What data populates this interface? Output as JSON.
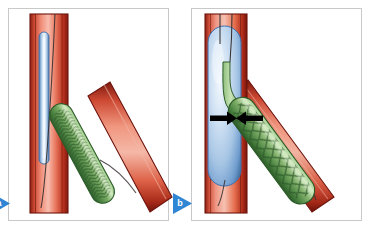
{
  "figure": {
    "background_color": "#ffffff",
    "width": 370,
    "height": 229,
    "panel_frame_color": "#c9c9c9"
  },
  "palette": {
    "vessel_red_dark": "#8c1f14",
    "vessel_red_mid": "#d24a35",
    "vessel_red_light": "#f09a86",
    "vessel_highlight": "#f7c4b5",
    "vessel_outline": "#6e140c",
    "balloon_blue_dark": "#3f6fae",
    "balloon_blue_mid": "#9fc2e4",
    "balloon_blue_light": "#eaf2fb",
    "stent_green_dark": "#2f6b35",
    "stent_green_mid": "#6aa65c",
    "stent_green_light": "#a8cf92",
    "stent_mesh": "#31582c",
    "guidewire": "#332f2f",
    "arrow_black": "#000000",
    "marker_blue": "#2f86d4"
  },
  "panels": [
    {
      "id": "panel-a",
      "label": "a",
      "marker_label": "a",
      "caption": "Undeployed stent positioned across the side-branch ostium with deflated balloon in main vessel",
      "elements": {
        "main_vessel": "vertical artery",
        "side_branch": "diagonal artery",
        "balloon_state": "deflated",
        "stent_state": "crimped",
        "arrows_visible": "no"
      }
    },
    {
      "id": "panel-b",
      "label": "b",
      "marker_label": "b",
      "caption": "Balloon inflated in main vessel compressing the proximal stent segment; arrows indicate the compression point",
      "elements": {
        "main_vessel": "vertical artery",
        "side_branch": "diagonal artery",
        "balloon_state": "inflated",
        "stent_state": "deployed",
        "arrows_visible": "yes",
        "arrow_count": 2,
        "arrow_meaning": "opposing compression forces at stent ostium"
      }
    }
  ],
  "markers": [
    {
      "name": "marker-a",
      "letter": "a",
      "shape": "right-pointing-triangle",
      "color": "#2f86d4"
    },
    {
      "name": "marker-b",
      "letter": "b",
      "shape": "right-pointing-triangle",
      "color": "#2f86d4"
    }
  ]
}
